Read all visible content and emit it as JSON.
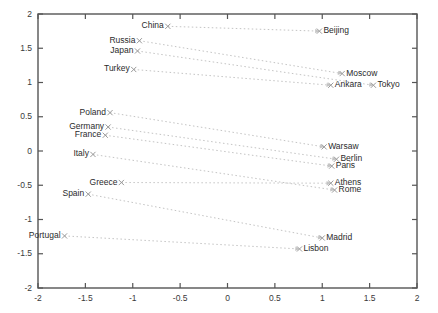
{
  "chart_data": {
    "type": "scatter",
    "title": "",
    "xlabel": "",
    "ylabel": "",
    "xlim": [
      -2,
      2
    ],
    "ylim": [
      -2,
      2
    ],
    "grid": false,
    "legend": "none",
    "xticks": [
      "-2",
      "-1.5",
      "-1",
      "-0.5",
      "0",
      "0.5",
      "1",
      "1.5",
      "2"
    ],
    "xtickvalues": [
      -2,
      -1.5,
      -1,
      -0.5,
      0,
      0.5,
      1,
      1.5,
      2
    ],
    "yticks": [
      "2",
      "1.5",
      "1",
      "0.5",
      "0",
      "-0.5",
      "-1",
      "-1.5",
      "-2"
    ],
    "ytickvalues": [
      2,
      1.5,
      1,
      0.5,
      0,
      -0.5,
      -1,
      -1.5,
      -2
    ],
    "marker": "x",
    "marker_color": "#9a9a9a",
    "line_style": "dotted",
    "line_color": "#c4c4c4",
    "pairs": [
      {
        "country": "China",
        "capital": "Beijing",
        "country_x": -0.63,
        "country_y": 1.82,
        "capital_x": 0.97,
        "capital_y": 1.75
      },
      {
        "country": "Russia",
        "capital": "Moscow",
        "country_x": -0.93,
        "country_y": 1.61,
        "capital_x": 1.21,
        "capital_y": 1.13
      },
      {
        "country": "Japan",
        "capital": "Tokyo",
        "country_x": -0.95,
        "country_y": 1.46,
        "capital_x": 1.54,
        "capital_y": 0.96
      },
      {
        "country": "Turkey",
        "capital": "Ankara",
        "country_x": -0.99,
        "country_y": 1.19,
        "capital_x": 1.09,
        "capital_y": 0.96
      },
      {
        "country": "Poland",
        "capital": "Warsaw",
        "country_x": -1.24,
        "country_y": 0.56,
        "capital_x": 1.02,
        "capital_y": 0.06
      },
      {
        "country": "Germany",
        "capital": "Berlin",
        "country_x": -1.26,
        "country_y": 0.35,
        "capital_x": 1.15,
        "capital_y": -0.12
      },
      {
        "country": "France",
        "capital": "Paris",
        "country_x": -1.29,
        "country_y": 0.23,
        "capital_x": 1.1,
        "capital_y": -0.22
      },
      {
        "country": "Italy",
        "capital": "Rome",
        "country_x": -1.42,
        "country_y": -0.05,
        "capital_x": 1.13,
        "capital_y": -0.57
      },
      {
        "country": "Greece",
        "capital": "Athens",
        "country_x": -1.12,
        "country_y": -0.46,
        "capital_x": 1.09,
        "capital_y": -0.47
      },
      {
        "country": "Spain",
        "capital": "Madrid",
        "country_x": -1.47,
        "country_y": -0.63,
        "capital_x": 1.0,
        "capital_y": -1.27
      },
      {
        "country": "Portugal",
        "capital": "Lisbon",
        "country_x": -1.72,
        "country_y": -1.24,
        "capital_x": 0.76,
        "capital_y": -1.43
      }
    ]
  },
  "axes": {
    "frame_color": "#555555",
    "left": 38,
    "right": 417,
    "top": 14,
    "bottom": 288
  }
}
